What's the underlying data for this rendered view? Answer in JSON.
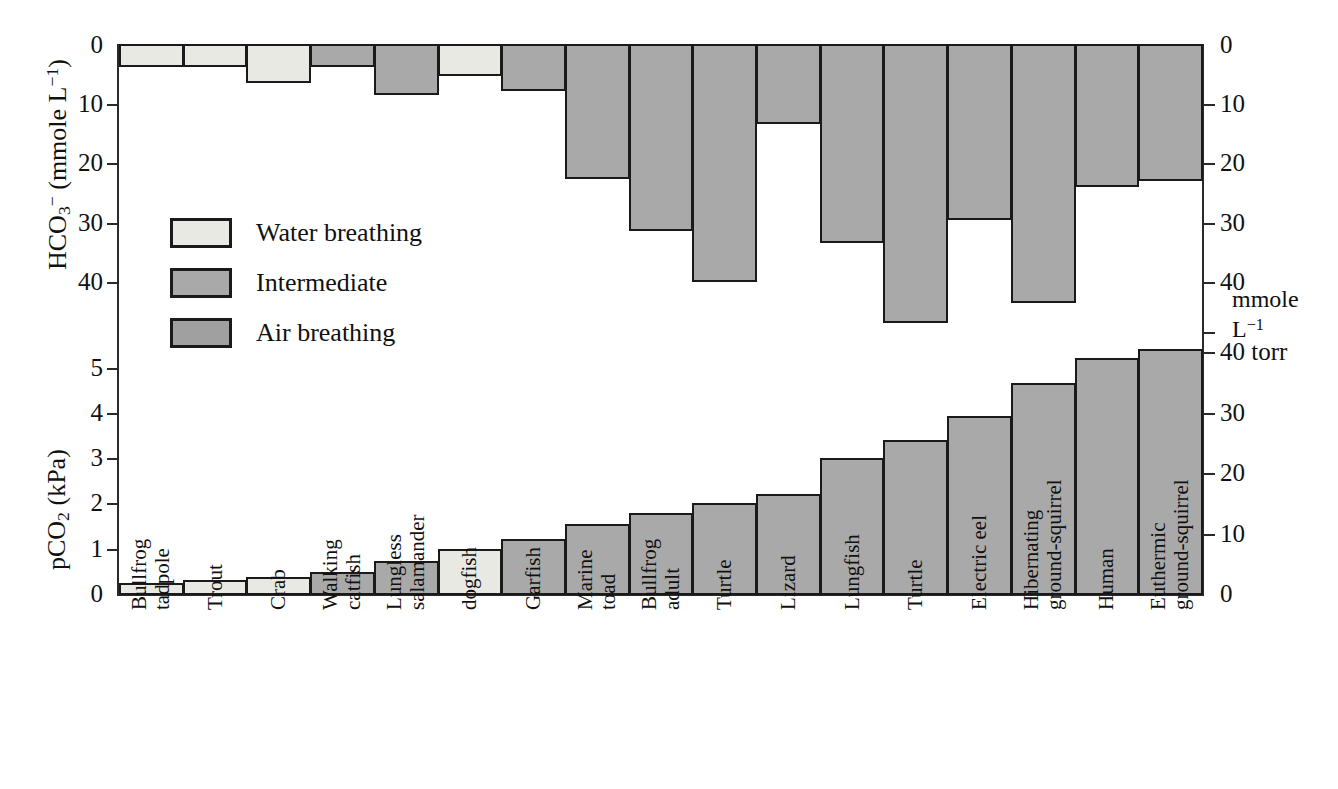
{
  "chart_data": {
    "type": "bar",
    "title": "",
    "subtitle": "",
    "orientation": "vertical",
    "grid": false,
    "legend_position": "inside-left",
    "categories": [
      "Bullfrog tadpole",
      "Trout",
      "Crab",
      "Walking catfish",
      "Lungless salamander",
      "dogfish",
      "Garfish",
      "Marine toad",
      "Bullfrog adult",
      "Turtle",
      "Lizard",
      "Lungfish",
      "Turtle",
      "Electric eel",
      "Hibernating ground-squirrel",
      "Human",
      "Euthermic ground-squirrel"
    ],
    "category_lines": [
      [
        "Bullfrog",
        "tadpole"
      ],
      [
        "Trout"
      ],
      [
        "Crab"
      ],
      [
        "Walking",
        "catfish"
      ],
      [
        "Lungless",
        "salamander"
      ],
      [
        "dogfish"
      ],
      [
        "Garfish"
      ],
      [
        "Marine",
        "toad"
      ],
      [
        "Bullfrog",
        "adult"
      ],
      [
        "Turtle"
      ],
      [
        "Lizard"
      ],
      [
        "Lungfish"
      ],
      [
        "Turtle"
      ],
      [
        "Electric eel"
      ],
      [
        "Hibernating",
        "ground-squirrel"
      ],
      [
        "Human"
      ],
      [
        "Euthermic",
        "ground-squirrel"
      ]
    ],
    "groups": [
      "water",
      "water",
      "water",
      "intermediate",
      "intermediate",
      "water",
      "intermediate",
      "intermediate",
      "intermediate",
      "intermediate",
      "intermediate",
      "intermediate",
      "intermediate",
      "intermediate",
      "intermediate",
      "intermediate",
      "intermediate"
    ],
    "series": [
      {
        "name": "HCO3-",
        "panel": "upper",
        "direction": "down",
        "ylabel": "HCO3- (mmole L-1)",
        "ylim": [
          0,
          52
        ],
        "yticks": [
          0,
          10,
          20,
          30,
          40
        ],
        "ytick_labels": [
          "0",
          "10",
          "20",
          "30",
          "40"
        ],
        "right_yticks": [
          0,
          10,
          20,
          30,
          40
        ],
        "right_ytick_labels": [
          "0",
          "10",
          "20",
          "30",
          "40"
        ],
        "right_unit_label_line1": "mmole",
        "right_unit_label_line2": "L-1",
        "values": [
          3.7,
          3.7,
          6.5,
          3.7,
          8.5,
          5.2,
          7.8,
          22.7,
          31.5,
          40.0,
          13.3,
          33.5,
          47.0,
          29.5,
          43.5,
          24.0,
          23.0
        ]
      },
      {
        "name": "pCO2",
        "panel": "lower",
        "direction": "up",
        "ylabel": "pCO2 (kPa)",
        "ylim": [
          0,
          6
        ],
        "yticks": [
          0,
          1,
          2,
          3,
          4,
          5
        ],
        "ytick_labels": [
          "0",
          "1",
          "2",
          "3",
          "4",
          "5"
        ],
        "right_yticks": [
          0,
          10,
          20,
          30,
          40
        ],
        "right_ytick_labels": [
          "0",
          "10",
          "20",
          "30",
          "40 torr"
        ],
        "values": [
          0.25,
          0.32,
          0.38,
          0.48,
          0.72,
          1.0,
          1.22,
          1.55,
          1.78,
          2.0,
          2.2,
          3.0,
          3.4,
          3.92,
          4.65,
          5.2,
          5.4
        ]
      }
    ],
    "legend": [
      {
        "key": "water",
        "label": "Water breathing",
        "color": "#e9e9e4"
      },
      {
        "key": "intermediate",
        "label": "Intermediate",
        "color": "#a9a9a9"
      },
      {
        "key": "air",
        "label": "Air breathing",
        "color": "#a0a0a0"
      }
    ]
  },
  "axes": {
    "left_upper_title_html": "HCO<sub>3</sub><sup>−</sup> (mmole L<sup>−1</sup>)",
    "left_lower_title_html": "pCO<sub>2</sub> (kPa)",
    "right_unit_line1": "mmole",
    "right_unit_line2_html": "L<sup>−1</sup>",
    "right_torr_label": "40 torr"
  },
  "colors": {
    "water": "#e9e9e4",
    "intermediate": "#a9a9a9",
    "air": "#a0a0a0",
    "outline": "#1a1a1a",
    "axis": "#2a2a2a"
  }
}
